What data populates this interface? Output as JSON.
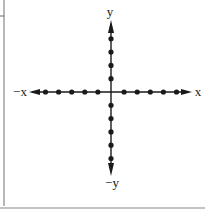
{
  "diagram": {
    "title": "",
    "type": "coordinate-axes",
    "labels": {
      "x_pos": "x",
      "x_neg": "−x",
      "y_pos": "y",
      "y_neg": "−y"
    },
    "colors": {
      "ink": "#1a1a1a",
      "frame": "#888888",
      "background": "#ffffff"
    },
    "x_axis_points": [
      -5,
      -4,
      -3,
      -2,
      -1,
      1,
      2,
      3,
      4,
      5
    ],
    "y_axis_points": [
      4,
      3,
      2,
      1,
      -1,
      -2,
      -3,
      -4,
      -5
    ]
  }
}
